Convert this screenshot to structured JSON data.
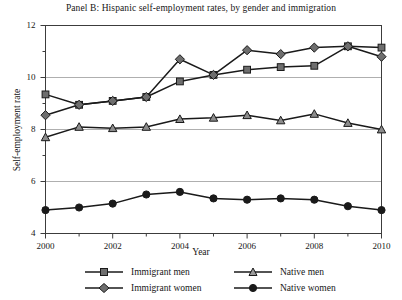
{
  "chart_data": {
    "type": "line",
    "title": "Panel B: Hispanic self-employment rates, by gender and immigration",
    "xlabel": "Year",
    "ylabel": "Self-employment rate",
    "x": [
      2000,
      2001,
      2002,
      2003,
      2004,
      2005,
      2006,
      2007,
      2008,
      2009,
      2010
    ],
    "xlim": [
      2000,
      2010
    ],
    "ylim": [
      4,
      12
    ],
    "ytick_labels": [
      "4",
      "6",
      "8",
      "10",
      "12"
    ],
    "yticks": [
      4,
      6,
      8,
      10,
      12
    ],
    "yminor_step": 1,
    "xtick_labels": [
      "2000",
      "2002",
      "2004",
      "2006",
      "2008",
      "2010"
    ],
    "xticks": [
      2000,
      2002,
      2004,
      2006,
      2008,
      2010
    ],
    "xminor_step": 1,
    "grid": "horizontal gridlines at 6, 8, 10",
    "legend_position": "below axes, two columns",
    "series": [
      {
        "name": "Immigrant men",
        "marker": "square",
        "values": [
          9.35,
          8.95,
          9.1,
          9.25,
          9.85,
          10.1,
          10.3,
          10.4,
          10.45,
          11.2,
          11.15
        ]
      },
      {
        "name": "Native men",
        "marker": "triangle",
        "values": [
          7.7,
          8.1,
          8.05,
          8.1,
          8.4,
          8.45,
          8.55,
          8.35,
          8.6,
          8.25,
          8.0
        ]
      },
      {
        "name": "Immigrant women",
        "marker": "diamond",
        "values": [
          8.55,
          8.95,
          9.1,
          9.25,
          10.7,
          10.1,
          11.05,
          10.9,
          11.15,
          11.2,
          10.8
        ]
      },
      {
        "name": "Native women",
        "marker": "circle",
        "values": [
          4.9,
          5.0,
          5.15,
          5.5,
          5.6,
          5.35,
          5.3,
          5.35,
          5.3,
          5.05,
          4.9
        ]
      }
    ],
    "colors": {
      "line": "#1a1a1a",
      "marker_fill_immigrant": "#6e6e6e",
      "marker_fill_native_men": "#8c8c8c",
      "marker_fill_native_women": "#1a1a1a",
      "grid": "#9a9a9a",
      "frame": "#3c3c3c"
    }
  }
}
